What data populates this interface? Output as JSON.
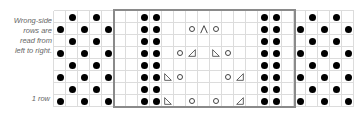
{
  "legend": {
    "lines": [
      "Wrong-side",
      "rows are",
      "read from",
      "left to right."
    ],
    "row_label": "1 row"
  },
  "chart": {
    "cols": 25,
    "rows": 8,
    "cell_px": 12,
    "box": {
      "col_start": 5,
      "col_end": 19
    },
    "symbols": {
      "dot": "purl (wrong-side knit)",
      "o": "yarn over",
      "ssk": "left-leaning decrease",
      "k2tog": "right-leaning decrease",
      "cdd": "centered double decrease"
    },
    "rows_top_to_bottom": [
      {
        "dots": [
          1,
          3,
          7,
          8,
          17,
          18,
          21,
          23
        ],
        "marks": []
      },
      {
        "dots": [
          0,
          2,
          4,
          7,
          8,
          17,
          18,
          20,
          22,
          24
        ],
        "marks": [
          {
            "c": 11,
            "t": "o"
          },
          {
            "c": 12,
            "t": "cdd"
          },
          {
            "c": 13,
            "t": "o"
          }
        ]
      },
      {
        "dots": [
          1,
          3,
          7,
          8,
          17,
          18,
          21,
          23
        ],
        "marks": []
      },
      {
        "dots": [
          0,
          2,
          4,
          7,
          8,
          17,
          18,
          20,
          22,
          24
        ],
        "marks": [
          {
            "c": 10,
            "t": "o"
          },
          {
            "c": 11,
            "t": "k2tog"
          },
          {
            "c": 13,
            "t": "ssk"
          },
          {
            "c": 14,
            "t": "o"
          }
        ]
      },
      {
        "dots": [
          1,
          3,
          7,
          8,
          17,
          18,
          21,
          23
        ],
        "marks": []
      },
      {
        "dots": [
          0,
          2,
          4,
          7,
          8,
          17,
          18,
          20,
          22,
          24
        ],
        "marks": [
          {
            "c": 9,
            "t": "ssk"
          },
          {
            "c": 10,
            "t": "o"
          },
          {
            "c": 14,
            "t": "o"
          },
          {
            "c": 15,
            "t": "k2tog"
          }
        ]
      },
      {
        "dots": [
          1,
          3,
          7,
          8,
          17,
          18,
          21,
          23
        ],
        "marks": []
      },
      {
        "dots": [
          0,
          2,
          4,
          7,
          8,
          17,
          18,
          20,
          22,
          24
        ],
        "marks": [
          {
            "c": 9,
            "t": "ssk"
          },
          {
            "c": 11,
            "t": "o"
          },
          {
            "c": 13,
            "t": "o"
          },
          {
            "c": 15,
            "t": "k2tog"
          }
        ]
      }
    ]
  },
  "colors": {
    "grid": "#dcdcdc",
    "box": "#8a8a8a",
    "dot": "#000000",
    "symbol": "#444444",
    "text": "#666666"
  }
}
